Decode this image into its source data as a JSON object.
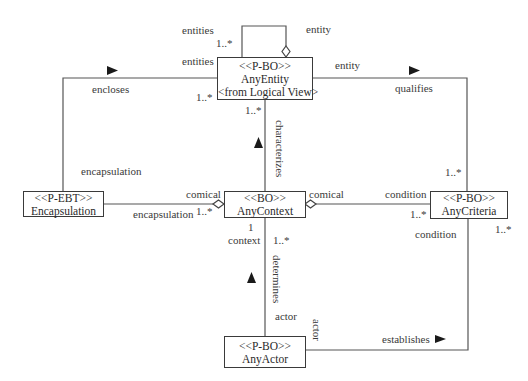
{
  "classes": {
    "any_entity": {
      "stereotype": "<<P-BO>>",
      "name": "AnyEntity",
      "note": "<from Logical View>"
    },
    "encapsulation": {
      "stereotype": "<<P-EBT>>",
      "name": "Encapsulation"
    },
    "any_context": {
      "stereotype": "<<BO>>",
      "name": "AnyContext"
    },
    "any_criteria": {
      "stereotype": "<<P-BO>>",
      "name": "AnyCriteria"
    },
    "any_actor": {
      "stereotype": "<<P-BO>>",
      "name": "AnyActor"
    }
  },
  "associations": {
    "self_loop": {
      "role_top": "entities",
      "mult_top": "1..*",
      "role_bottom": "entities",
      "role_entity": "entity"
    },
    "encloses": {
      "name": "encloses",
      "mult_entity": "1..*",
      "role_encapsulation": "encapsulation"
    },
    "qualifies": {
      "name": "qualifies",
      "role_entity": "entity",
      "mult_criteria": "1..*"
    },
    "characterizes": {
      "name": "characterizes",
      "mult_entity": "1..*"
    },
    "encapsulation_context": {
      "role_context": "comical",
      "role_encapsulation": "encapsulation",
      "mult": "1..*"
    },
    "context_criteria": {
      "role_context": "comical",
      "role_criteria": "condition",
      "mult": "1..*"
    },
    "determines": {
      "name": "determines",
      "mult_context": "1",
      "role_context": "context",
      "mult_actor": "1..*",
      "role_actor": "actor"
    },
    "establishes": {
      "name": "establishes",
      "role_actor": "actor",
      "role_criteria": "condition",
      "mult_criteria": "1..*"
    }
  }
}
